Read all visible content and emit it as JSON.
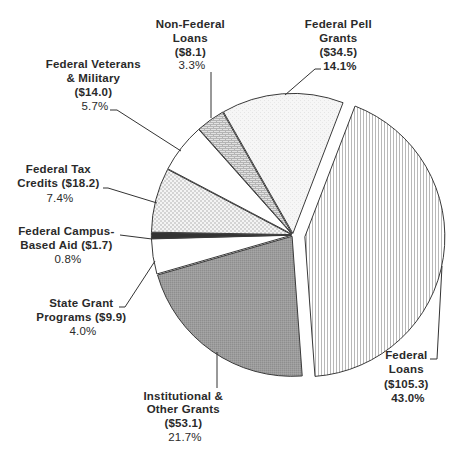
{
  "chart_data": {
    "type": "pie",
    "title": "",
    "direction": "clockwise",
    "start_angle_deg": 21,
    "exploded": [
      "Federal Loans"
    ],
    "categories": [
      "Federal Loans",
      "Institutional & Other Grants",
      "State Grant Programs",
      "Federal Campus-Based Aid",
      "Federal Tax Credits",
      "Federal Veterans & Military",
      "Non-Federal Loans",
      "Federal Pell Grants"
    ],
    "values": [
      105.3,
      53.1,
      9.9,
      1.7,
      18.2,
      14.0,
      8.1,
      34.5
    ],
    "percentages": [
      43.0,
      21.7,
      4.0,
      0.8,
      7.4,
      5.7,
      3.3,
      14.1
    ],
    "fills": [
      "vertical-lines",
      "medium-gray",
      "white",
      "dark",
      "checker",
      "white",
      "brick",
      "light-dots"
    ]
  },
  "labels": [
    {
      "lines": [
        "Federal",
        "Loans",
        "($105.3)",
        "43.0%"
      ]
    },
    {
      "lines": [
        "Institutional &",
        "Other Grants",
        "($53.1)",
        "21.7%"
      ]
    },
    {
      "lines": [
        "State Grant",
        "Programs ($9.9)",
        "4.0%"
      ]
    },
    {
      "lines": [
        "Federal Campus-",
        "Based Aid ($1.7)",
        "0.8%"
      ]
    },
    {
      "lines": [
        "Federal Tax",
        "Credits ($18.2)",
        "7.4%"
      ]
    },
    {
      "lines": [
        "Federal Veterans",
        "& Military",
        "($14.0)",
        "5.7%"
      ]
    },
    {
      "lines": [
        "Non-Federal",
        "Loans",
        "($8.1)",
        "3.3%"
      ]
    },
    {
      "lines": [
        "Federal Pell",
        "Grants",
        "($34.5)",
        "14.1%"
      ]
    }
  ],
  "colors": {
    "outline": "#3a3a3a",
    "text": "#2a2a2a",
    "medium_gray": "#9a9a9a",
    "dark": "#333333",
    "light": "#f3f3f3"
  }
}
